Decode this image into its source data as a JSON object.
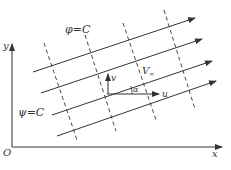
{
  "diagram": {
    "type": "flow-field",
    "axes": {
      "x_label": "x",
      "y_label": "y",
      "origin_label": "O"
    },
    "labels": {
      "equipotential": "φ=C",
      "streamline": "ψ=C",
      "velocity": "V",
      "velocity_subscript": "∞",
      "angle": "α",
      "u_component": "u",
      "v_component": "v"
    },
    "streamlines": [
      {
        "x1": 33,
        "y1": 72,
        "x2": 195,
        "y2": 18
      },
      {
        "x1": 41,
        "y1": 93,
        "x2": 202,
        "y2": 39
      },
      {
        "x1": 52,
        "y1": 115,
        "x2": 212,
        "y2": 61
      },
      {
        "x1": 57,
        "y1": 136,
        "x2": 216,
        "y2": 81
      }
    ],
    "equipotentials": [
      {
        "x1": 44,
        "y1": 43,
        "x2": 77,
        "y2": 140
      },
      {
        "x1": 85,
        "y1": 35,
        "x2": 116,
        "y2": 131
      },
      {
        "x1": 123,
        "y1": 23,
        "x2": 156,
        "y2": 120
      },
      {
        "x1": 164,
        "y1": 10,
        "x2": 195,
        "y2": 109
      }
    ],
    "colors": {
      "line": "#333333"
    }
  }
}
